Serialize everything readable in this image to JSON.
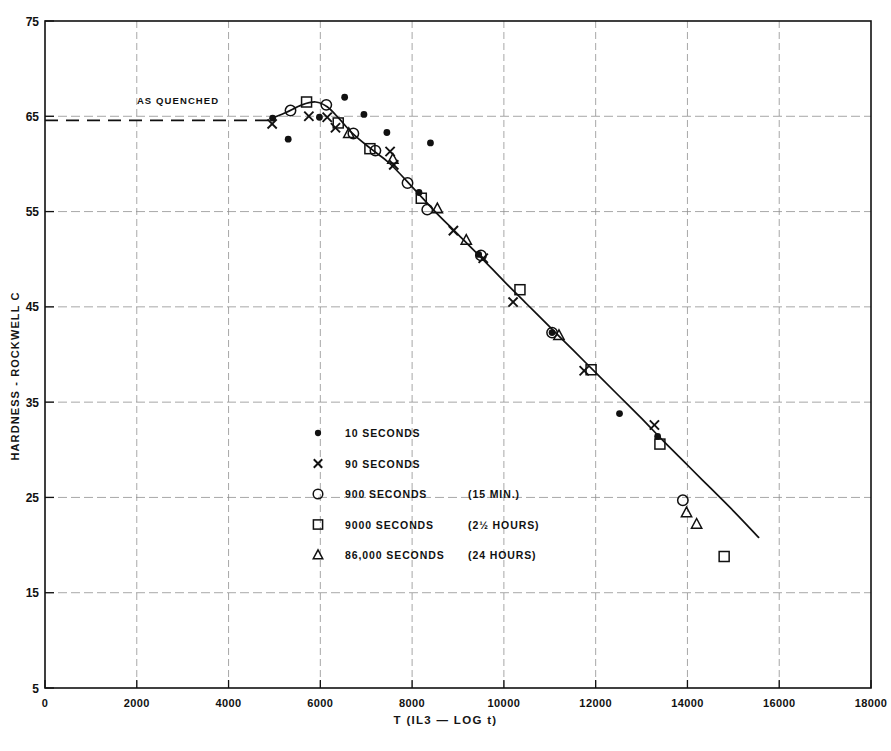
{
  "chart_data": {
    "type": "scatter",
    "title": "",
    "xlabel": "T (IL3 — LOG t)",
    "ylabel": "HARDNESS - ROCKWELL C",
    "xlim": [
      0,
      18000
    ],
    "ylim": [
      5,
      75
    ],
    "xticks": [
      0,
      2000,
      4000,
      6000,
      8000,
      10000,
      12000,
      14000,
      16000,
      18000
    ],
    "xtick_labels": [
      "0",
      "2000",
      "4000",
      "6000",
      "8000",
      "10000",
      "12000",
      "14000",
      "16000",
      "18000"
    ],
    "yticks": [
      5,
      15,
      25,
      35,
      45,
      55,
      65,
      75
    ],
    "ytick_labels": [
      "5",
      "15",
      "25",
      "35",
      "45",
      "55",
      "65",
      "75"
    ],
    "grid": true,
    "grid_style": "dashed-light",
    "legend_position": "center-left-inside",
    "annotations": [
      {
        "text": "AS QUENCHED",
        "x": 2900,
        "y": 66.3,
        "kind": "reference-line-label"
      }
    ],
    "reference_line": {
      "label": "AS QUENCHED",
      "y": 65.0,
      "x_start": 0,
      "x_end": 4900,
      "style": "dashed"
    },
    "fit_curve": {
      "name": "tempering master curve",
      "style": "solid",
      "points": [
        [
          4950,
          64.8
        ],
        [
          5250,
          65.4
        ],
        [
          5600,
          66.2
        ],
        [
          5900,
          66.5
        ],
        [
          6150,
          66.0
        ],
        [
          6400,
          64.8
        ],
        [
          6700,
          63.2
        ],
        [
          7100,
          61.6
        ],
        [
          7500,
          60.1
        ],
        [
          8000,
          57.6
        ],
        [
          8500,
          55.0
        ],
        [
          9000,
          52.6
        ],
        [
          9500,
          50.2
        ],
        [
          10000,
          47.7
        ],
        [
          10500,
          45.3
        ],
        [
          11000,
          42.9
        ],
        [
          11500,
          40.5
        ],
        [
          12000,
          38.1
        ],
        [
          12500,
          35.7
        ],
        [
          13000,
          33.3
        ],
        [
          13500,
          30.8
        ],
        [
          14000,
          28.4
        ],
        [
          14500,
          26.0
        ],
        [
          15000,
          23.6
        ],
        [
          15550,
          20.8
        ]
      ]
    },
    "series": [
      {
        "name": "10  SECONDS",
        "marker": "filled-circle",
        "legend_label": "10  SECONDS",
        "points": [
          [
            4960,
            64.8
          ],
          [
            5300,
            62.6
          ],
          [
            5980,
            64.9
          ],
          [
            6530,
            67.0
          ],
          [
            6950,
            65.2
          ],
          [
            7450,
            63.3
          ],
          [
            8400,
            62.2
          ],
          [
            8150,
            57.0
          ],
          [
            9450,
            50.5
          ],
          [
            11050,
            42.3
          ],
          [
            12520,
            33.8
          ],
          [
            13350,
            31.4
          ]
        ]
      },
      {
        "name": "90  SECONDS",
        "marker": "x",
        "legend_label": "90  SECONDS",
        "points": [
          [
            4950,
            64.2
          ],
          [
            5750,
            65.0
          ],
          [
            6150,
            64.9
          ],
          [
            6330,
            63.8
          ],
          [
            7520,
            61.3
          ],
          [
            7600,
            59.9
          ],
          [
            8900,
            53.0
          ],
          [
            9550,
            50.1
          ],
          [
            10200,
            45.5
          ],
          [
            11750,
            38.3
          ],
          [
            13280,
            32.6
          ]
        ]
      },
      {
        "name": "900 SECONDS      (15 MIN.)",
        "marker": "open-circle",
        "legend_label": "900 SECONDS",
        "legend_note": "(15 MIN.)",
        "points": [
          [
            5350,
            65.6
          ],
          [
            6130,
            66.2
          ],
          [
            6720,
            63.2
          ],
          [
            7200,
            61.4
          ],
          [
            7900,
            58.0
          ],
          [
            8330,
            55.2
          ],
          [
            9500,
            50.4
          ],
          [
            11050,
            42.3
          ],
          [
            13900,
            24.7
          ]
        ]
      },
      {
        "name": "9000 SECONDS     (2 1/2 HOURS)",
        "marker": "open-square",
        "legend_label": "9000 SECONDS",
        "legend_note": "(2½ HOURS)",
        "points": [
          [
            5700,
            66.5
          ],
          [
            6390,
            64.3
          ],
          [
            7080,
            61.6
          ],
          [
            8200,
            56.4
          ],
          [
            10350,
            46.8
          ],
          [
            11900,
            38.4
          ],
          [
            13400,
            30.6
          ],
          [
            14800,
            18.8
          ]
        ]
      },
      {
        "name": "86,000 SECONDS   (24 HOURS)",
        "marker": "open-triangle",
        "legend_label": "86,000 SECONDS",
        "legend_note": "(24 HOURS)",
        "points": [
          [
            6620,
            63.2
          ],
          [
            7580,
            60.5
          ],
          [
            8550,
            55.3
          ],
          [
            9180,
            52.0
          ],
          [
            11200,
            42.0
          ],
          [
            13980,
            23.4
          ],
          [
            14200,
            22.2
          ]
        ]
      }
    ]
  },
  "legend": {
    "items": [
      {
        "marker": "filled-circle",
        "label": "10   SECONDS",
        "note": ""
      },
      {
        "marker": "x",
        "label": "90  SECONDS",
        "note": ""
      },
      {
        "marker": "open-circle",
        "label": "900 SECONDS",
        "note": "(15 MIN.)"
      },
      {
        "marker": "open-square",
        "label": "9000 SECONDS",
        "note": "(2½ HOURS)"
      },
      {
        "marker": "open-triangle",
        "label": "86,000 SECONDS",
        "note": "(24 HOURS)"
      }
    ]
  },
  "axes": {
    "y_title": "HARDNESS - ROCKWELL C",
    "x_title": "T (IL3 — LOG t)"
  },
  "colors": {
    "ink": "#111111",
    "grid": "#8d8d8d",
    "background": "#ffffff"
  }
}
